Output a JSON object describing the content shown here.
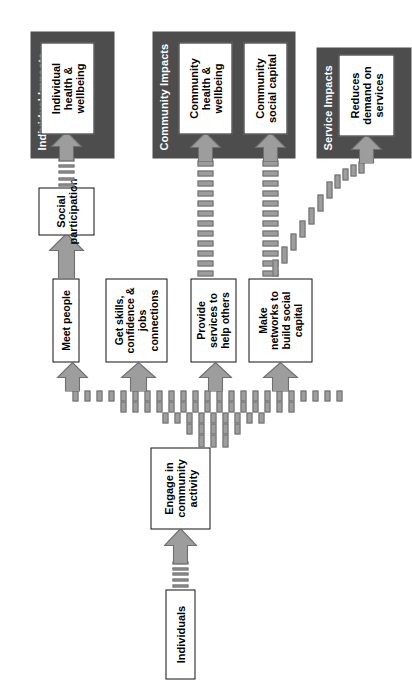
{
  "diagram": {
    "colors": {
      "panel_dark": "#4d4d4d",
      "panel_text": "#ffffff",
      "box_fill": "#ffffff",
      "box_border": "#111111",
      "arrow_fill": "#9d9d9d",
      "arrow_border": "#6f6f6f",
      "background": "#ffffff"
    },
    "panels": [
      {
        "id": "individual",
        "label": "Individual Impacts"
      },
      {
        "id": "community",
        "label": "Community Impacts"
      },
      {
        "id": "service",
        "label": "Service Impacts"
      }
    ],
    "nodes": {
      "individuals": "Individuals",
      "engage": "Engage in community activity",
      "meet_people": "Meet people",
      "get_skills": "Get skills, confidence & jobs connections",
      "provide_services": "Provide services to help others",
      "make_networks": "Make networks to build social capital",
      "social_participation": "Social participation",
      "individual_health": "Individual health & wellbeing",
      "community_health": "Community health & wellbeing",
      "community_capital": "Community social capital",
      "reduces_demand": "Reduces demand on services"
    },
    "node_lines": {
      "engage": [
        "Engage in",
        "community",
        "activity"
      ],
      "get_skills": [
        "Get skills,",
        "confidence &",
        "jobs",
        "connections"
      ],
      "provide_services": [
        "Provide",
        "services to",
        "help others"
      ],
      "make_networks": [
        "Make",
        "networks to",
        "build social",
        "capital"
      ],
      "social_participation": [
        "Social",
        "participation"
      ],
      "individual_health": [
        "Individual",
        "health &",
        "wellbeing"
      ],
      "community_health": [
        "Community",
        "health &",
        "wellbeing"
      ],
      "community_capital": [
        "Community",
        "social capital"
      ],
      "reduces_demand": [
        "Reduces",
        "demand on",
        "services"
      ]
    },
    "flows": [
      {
        "from": "individuals",
        "to": "engage",
        "style": "dashed-block-arrow"
      },
      {
        "from": "engage",
        "to": "meet_people",
        "style": "fan-dashed"
      },
      {
        "from": "engage",
        "to": "get_skills",
        "style": "fan-dashed"
      },
      {
        "from": "engage",
        "to": "provide_services",
        "style": "fan-dashed"
      },
      {
        "from": "engage",
        "to": "make_networks",
        "style": "fan-dashed"
      },
      {
        "from": "meet_people",
        "to": "social_participation",
        "style": "solid-block-arrow"
      },
      {
        "from": "social_participation",
        "to": "individual_health",
        "style": "dashed-block-arrow"
      },
      {
        "from": "provide_services",
        "to": "community_health",
        "style": "dashed-block-arrow"
      },
      {
        "from": "make_networks",
        "to": "community_capital",
        "style": "dashed-block-arrow"
      },
      {
        "from": "make_networks",
        "to": "reduces_demand",
        "style": "diagonal-dashed-arrow"
      }
    ]
  }
}
